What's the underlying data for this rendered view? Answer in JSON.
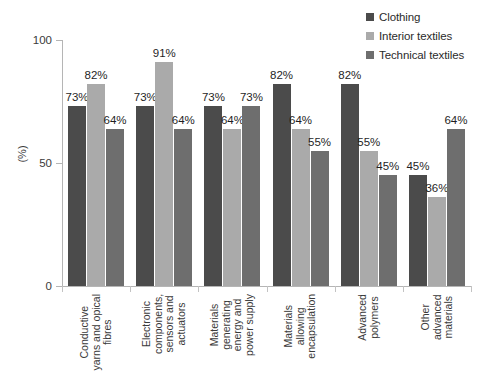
{
  "chart_data": {
    "type": "bar",
    "title": "",
    "subtitle": "",
    "xlabel": "",
    "ylabel": "(%)",
    "ylim": [
      0,
      100
    ],
    "yticks": [
      0,
      50,
      100
    ],
    "grid": false,
    "legend_position": "top-right",
    "value_suffix": "%",
    "categories": [
      "Conductive yarns and opical fibres",
      "Electronic components, sensors and actuators",
      "Materials generating energy and power supply",
      "Materials allowing encapsulation",
      "Advanced polymers",
      "Other advanced materials"
    ],
    "category_lines": [
      [
        "Conductive",
        "yarns and opical",
        "fibres"
      ],
      [
        "Electronic",
        "components,",
        "sensors and",
        "actuators"
      ],
      [
        "Materials",
        "generating",
        "energy and",
        "power supply"
      ],
      [
        "Materials",
        "allowing",
        "encapsulation"
      ],
      [
        "Advanced",
        "polymers"
      ],
      [
        "Other",
        "advanced",
        "materials"
      ]
    ],
    "series": [
      {
        "name": "Clothing",
        "color": "#4b4b4b",
        "values": [
          73,
          73,
          73,
          82,
          82,
          45
        ],
        "labels": [
          "73%",
          "73%",
          "73%",
          "82%",
          "82%",
          "45%"
        ]
      },
      {
        "name": "Interior textiles",
        "color": "#aaaaaa",
        "values": [
          82,
          91,
          64,
          64,
          55,
          36
        ],
        "labels": [
          "82%",
          "91%",
          "64%",
          "64%",
          "55%",
          "36%"
        ]
      },
      {
        "name": "Technical textiles",
        "color": "#6e6e6e",
        "values": [
          64,
          64,
          73,
          55,
          45,
          64
        ],
        "labels": [
          "64%",
          "64%",
          "73%",
          "55%",
          "45%",
          "64%"
        ]
      }
    ]
  },
  "legend": {
    "items": [
      {
        "label": "Clothing",
        "color": "#4b4b4b"
      },
      {
        "label": "Interior textiles",
        "color": "#aaaaaa"
      },
      {
        "label": "Technical textiles",
        "color": "#6e6e6e"
      }
    ]
  },
  "axis": {
    "y_title": "(%)",
    "y_tick_labels": [
      "100",
      "50",
      "0"
    ]
  }
}
